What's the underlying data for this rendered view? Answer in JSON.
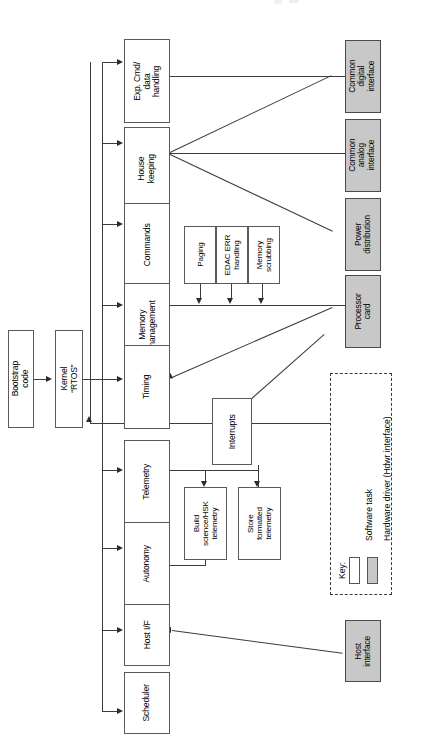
{
  "diagram": {
    "orientation": "rotated-90-ccw",
    "colors": {
      "software_task_fill": "#ffffff",
      "hardware_driver_fill": "#c8c8c8",
      "line": "#3c3c3c",
      "border": "#5a5a5a",
      "background": "#ffffff"
    }
  },
  "boot": {
    "bootstrap": "Bootstrap\ncode",
    "kernel": "Kernel\n“RTOS”"
  },
  "tasks": [
    {
      "id": "exp-cmd-data-handling",
      "label": "Exp. Cmd/\ndata\nhandling"
    },
    {
      "id": "house-keeping",
      "label": "House\nkeeping"
    },
    {
      "id": "commands",
      "label": "Commands"
    },
    {
      "id": "memory-management",
      "label": "Memory\nmanagement"
    },
    {
      "id": "timing",
      "label": "Timing"
    },
    {
      "id": "telemetry",
      "label": "Telemetry"
    },
    {
      "id": "autonomy",
      "label": "Autonomy"
    },
    {
      "id": "host-if",
      "label": "Host I/F"
    },
    {
      "id": "scheduler",
      "label": "Scheduler"
    }
  ],
  "memory_subtasks": [
    {
      "id": "paging",
      "label": "Paging"
    },
    {
      "id": "edac-err-handling",
      "label": "EDAC ERR\nhandling"
    },
    {
      "id": "memory-scrubbing",
      "label": "Memory\nscrubbing"
    }
  ],
  "telemetry_subtasks": [
    {
      "id": "build-science-hsk-telemetry",
      "label": "Build\nscience/HSK\ntelemetry"
    },
    {
      "id": "store-formatted-telemetry",
      "label": "Store\nformatted\ntelemetry"
    }
  ],
  "interrupts": {
    "id": "interrupts",
    "label": "Interrupts"
  },
  "hardware": [
    {
      "id": "common-digital-interface",
      "label": "Common\ndigital\ninterface"
    },
    {
      "id": "common-analog-interface",
      "label": "Common\nanalog\ninterface"
    },
    {
      "id": "power-distribution",
      "label": "Power\ndistribution"
    },
    {
      "id": "processor-card",
      "label": "Processor\ncard"
    },
    {
      "id": "host-interface",
      "label": "Host\ninterface"
    }
  ],
  "legend": {
    "title": "Key:",
    "entries": [
      {
        "id": "software-task",
        "label": "Software task",
        "fill": "#ffffff"
      },
      {
        "id": "hardware-driver",
        "label": "Hardware driver (Hdwr interface)",
        "fill": "#c8c8c8"
      }
    ]
  }
}
